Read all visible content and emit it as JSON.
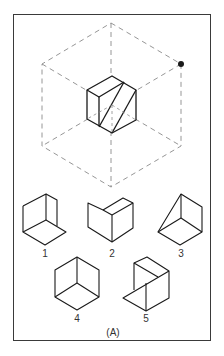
{
  "figure": {
    "caption": "(A)",
    "colors": {
      "line": "#1a1a1a",
      "dashed": "#8a8a8a",
      "frame": "#3a3a3a",
      "dot": "#1a1a1a"
    },
    "reference": {
      "description": "Cube with diagonal cuts inside dashed isometric hexagon",
      "marker": "filled-dot at upper-right vertex"
    },
    "options": [
      {
        "label": "1"
      },
      {
        "label": "2"
      },
      {
        "label": "3"
      },
      {
        "label": "4"
      },
      {
        "label": "5"
      }
    ]
  }
}
